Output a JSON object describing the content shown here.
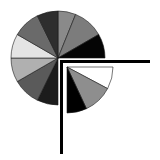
{
  "graphic": {
    "description": "Pie chart icon with one quarter pulled out and an L-shaped bracket",
    "main_pie": {
      "center": [
        58,
        58
      ],
      "radius": 47,
      "slices": [
        {
          "start": 0,
          "end": 22,
          "color": "#8a8a8a"
        },
        {
          "start": 22,
          "end": 60,
          "color": "#7c7c7c"
        },
        {
          "start": 60,
          "end": 90,
          "color": "#050505"
        },
        {
          "start": 180,
          "end": 206,
          "color": "#1c1c1c"
        },
        {
          "start": 206,
          "end": 240,
          "color": "#5a5a5a"
        },
        {
          "start": 240,
          "end": 270,
          "color": "#b0b0b0"
        },
        {
          "start": 270,
          "end": 300,
          "color": "#e4e4e4"
        },
        {
          "start": 300,
          "end": 334,
          "color": "#6a6a6a"
        },
        {
          "start": 334,
          "end": 360,
          "color": "#2e2e2e"
        }
      ]
    },
    "detached_slice": {
      "center": [
        67,
        67
      ],
      "radius": 46,
      "slices": [
        {
          "start": 90,
          "end": 118,
          "color": "#ffffff"
        },
        {
          "start": 118,
          "end": 155,
          "color": "#8e8e8e"
        },
        {
          "start": 155,
          "end": 180,
          "color": "#000000"
        }
      ]
    },
    "bracket": {
      "color": "#000000",
      "horizontal": {
        "x": 60,
        "y": 60,
        "width": 90,
        "height": 3
      },
      "vertical": {
        "x": 60,
        "y": 60,
        "width": 3,
        "height": 94
      }
    }
  }
}
